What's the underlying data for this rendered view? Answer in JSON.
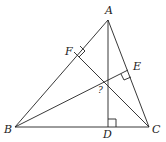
{
  "diagram": {
    "points": {
      "A": {
        "label": "A",
        "x": 108,
        "y": 20
      },
      "B": {
        "label": "B",
        "x": 15,
        "y": 127
      },
      "C": {
        "label": "C",
        "x": 149,
        "y": 127
      },
      "D": {
        "label": "D",
        "x": 108,
        "y": 127
      },
      "E": {
        "label": "E",
        "x": 128,
        "y": 70
      },
      "F": {
        "label": "F",
        "x": 74,
        "y": 52
      }
    },
    "intersection_label": "?",
    "line_color": "#222222"
  }
}
